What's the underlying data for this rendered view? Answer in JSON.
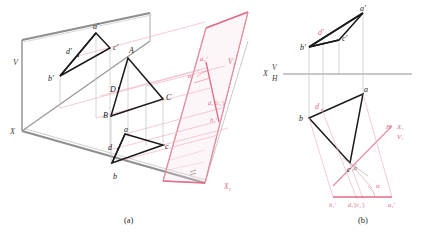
{
  "figure": {
    "title_a": "(a)",
    "title_b": "(b)",
    "colors": {
      "ink": "#1a1a1a",
      "aux": "#e58a9e",
      "aux_strong": "#e06a85",
      "plane_edge": "#8a8a8a",
      "thin": "#b8b8b8"
    }
  },
  "pictorial": {
    "plane_labels": {
      "v": "V",
      "h": "H",
      "x": "X",
      "x1": "X₁",
      "v1": "V₁"
    },
    "space_points": {
      "A": "A",
      "B": "B",
      "C": "C",
      "D": "D"
    },
    "front_projection": {
      "a": "a′",
      "b": "b′",
      "c": "c′",
      "d": "d′"
    },
    "top_projection": {
      "a": "a",
      "b": "b",
      "c": "c",
      "d": "d"
    },
    "aux_projection": {
      "a1": "a₁′",
      "b1": "b₁′",
      "dc1": "d₁′(c₁′)"
    },
    "angle": "α"
  },
  "orthographic": {
    "axis_label_x": "X",
    "axis_label_v": "V",
    "axis_label_h": "H",
    "aux_axis_h": "H",
    "aux_axis_x1": "X₁",
    "aux_axis_v1": "V₁",
    "front_projection": {
      "a": "a′",
      "b": "b′",
      "c": "c′",
      "d": "d′"
    },
    "top_projection": {
      "a": "a",
      "b": "b",
      "c": "c",
      "d": "d"
    },
    "aux_projection": {
      "a1": "a₁′",
      "b1": "b₁′",
      "dc1": "d₁′(c₁′)"
    },
    "angle_alpha": "α",
    "angle_theta": "α"
  }
}
